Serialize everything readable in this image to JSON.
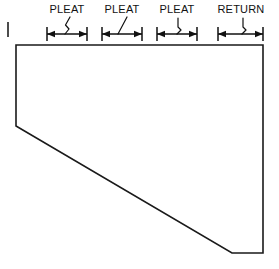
{
  "drawing": {
    "title": "Pleat and Return Dimension Drawing",
    "canvas": {
      "width": 279,
      "height": 269
    },
    "colors": {
      "background": "#ffffff",
      "line": "#1a1a1a",
      "dimension": "#111111",
      "text": "#111111"
    },
    "shape": {
      "name": "valance-panel-profile",
      "points": "16,45 263,45 263,253 232,253 16,126",
      "vertices": [
        {
          "x": 16,
          "y": 45
        },
        {
          "x": 263,
          "y": 45
        },
        {
          "x": 263,
          "y": 253
        },
        {
          "x": 232,
          "y": 253
        },
        {
          "x": 16,
          "y": 126
        }
      ]
    },
    "left_extension_tick": {
      "x": 8,
      "y1": 22,
      "y2": 37
    },
    "dimension_line_y": 34,
    "label_baseline_y": 13,
    "dimensions": [
      {
        "label": "PLEAT",
        "x1": 47,
        "x2": 87,
        "label_x": 67,
        "leader": "zigzag"
      },
      {
        "label": "PLEAT",
        "x1": 102,
        "x2": 142,
        "label_x": 122,
        "leader": "straight"
      },
      {
        "label": "PLEAT",
        "x1": 157,
        "x2": 197,
        "label_x": 177,
        "leader": "hook"
      },
      {
        "label": "RETURN",
        "x1": 218,
        "x2": 263,
        "label_x": 241,
        "leader": "hook"
      }
    ]
  }
}
